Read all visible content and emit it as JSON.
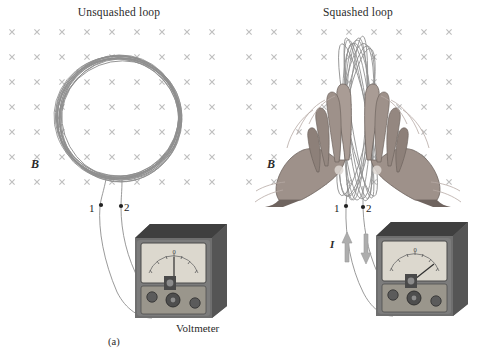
{
  "figure": {
    "caption_voltmeter": "Voltmeter",
    "panels": [
      {
        "id": "a",
        "title": "Unsquashed loop",
        "caption": "(a)",
        "field_label": "B",
        "field_symbol": "×",
        "field_direction": "into-page",
        "terminal_labels": [
          "1",
          "2"
        ],
        "meter_reading": "0",
        "needle_deflection_deg": 0,
        "current_label": null,
        "current_arrows": []
      },
      {
        "id": "b",
        "title": "Squashed loop",
        "caption": "(b)",
        "field_label": "B",
        "field_symbol": "×",
        "field_direction": "into-page",
        "terminal_labels": [
          "1",
          "2"
        ],
        "meter_reading": "0",
        "needle_deflection_deg": 34,
        "current_label": "I",
        "current_arrows": [
          "up",
          "down"
        ]
      }
    ],
    "grid": {
      "columns": 9,
      "rows": 7,
      "spacing_px": 25,
      "marker": "×"
    },
    "colors": {
      "wire": "#7d7d7d",
      "field_marker": "#b9b9b9",
      "meter_body_top": "#3b3b3b",
      "meter_body_side": "#6e6e6e",
      "meter_face": "#d9d5cb",
      "meter_panel": "#9a968c",
      "hand": "#9a8e88",
      "arrow": "#a9a9a9",
      "text": "#1b1b1b"
    }
  }
}
